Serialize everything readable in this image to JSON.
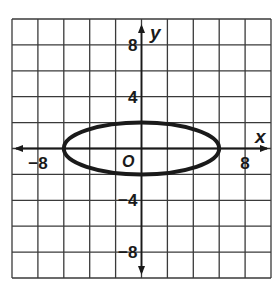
{
  "chart_data": {
    "type": "line",
    "title": "",
    "xlabel": "x",
    "ylabel": "y",
    "xlim": [
      -10,
      10
    ],
    "ylim": [
      -10,
      10
    ],
    "grid": true,
    "grid_step": 2,
    "x_ticks": [
      {
        "value": -8,
        "label": "−8"
      },
      {
        "value": 8,
        "label": "8"
      }
    ],
    "y_ticks": [
      {
        "value": 8,
        "label": "8"
      },
      {
        "value": 4,
        "label": "4"
      },
      {
        "value": -4,
        "label": "−4"
      },
      {
        "value": -8,
        "label": "−8"
      }
    ],
    "origin_label": "O",
    "series": [
      {
        "name": "ellipse",
        "shape": "ellipse",
        "center": [
          0,
          0
        ],
        "semi_major_x": 6,
        "semi_minor_y": 2,
        "equation": "x^2/36 + y^2/4 = 1",
        "vertices": [
          [
            -6,
            0
          ],
          [
            6,
            0
          ],
          [
            0,
            2
          ],
          [
            0,
            -2
          ]
        ],
        "color": "#1a1a1a"
      }
    ]
  },
  "colors": {
    "grid": "#3a3a3a",
    "axis": "#1a1a1a",
    "curve": "#1a1a1a",
    "background": "#ffffff"
  }
}
